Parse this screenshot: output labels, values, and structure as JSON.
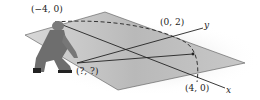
{
  "figure": {
    "labels": {
      "left_point": "(−4, 0)",
      "top_point": "(0, 2)",
      "unknown_point": "(?, ?)",
      "right_point": "(4, 0)",
      "y_axis": "y",
      "x_axis": "x"
    },
    "colors": {
      "plane": "#bdbdbd",
      "lines": "#222222",
      "person": "#6e6e6e"
    }
  }
}
